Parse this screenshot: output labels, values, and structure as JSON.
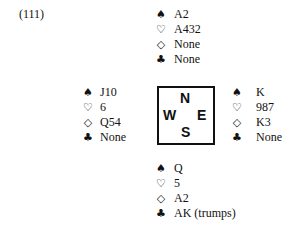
{
  "problem": {
    "number": "(111)"
  },
  "suit_icons": {
    "spade": "♠",
    "heart": "♡",
    "diamond": "◇",
    "club": "♣"
  },
  "compass": {
    "north": "N",
    "west": "W",
    "east": "E",
    "south": "S"
  },
  "hands": {
    "north": {
      "spades": "A2",
      "hearts": "A432",
      "diamonds": "None",
      "clubs": "None"
    },
    "west": {
      "spades": "J10",
      "hearts": "6",
      "diamonds": "Q54",
      "clubs": "None"
    },
    "east": {
      "spades": "K",
      "hearts": "987",
      "diamonds": "K3",
      "clubs": "None"
    },
    "south": {
      "spades": "Q",
      "hearts": "5",
      "diamonds": "A2",
      "clubs": "AK (trumps)"
    }
  }
}
